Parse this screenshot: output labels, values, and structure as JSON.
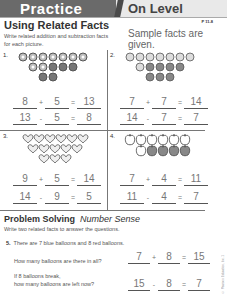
{
  "header": {
    "left": "Practice",
    "right": "On Level"
  },
  "title": "Using Related Facts",
  "page_number": "P 11-8",
  "instructions": "Write related addition and subtraction facts for each picture.",
  "sample_note": "Sample facts are given.",
  "problems": [
    {
      "number": "1.",
      "rows": [
        [
          7,
          "light"
        ],
        [
          2,
          "light",
          3,
          "dark"
        ],
        [
          2,
          "dark"
        ]
      ],
      "eq1": [
        "8",
        "+",
        "5",
        "=",
        "13"
      ],
      "eq2": [
        "13",
        "-",
        "5",
        "=",
        "8"
      ]
    },
    {
      "number": "2.",
      "rows": [
        [
          7,
          "light"
        ],
        [
          1,
          "light",
          4,
          "dark"
        ],
        [
          3,
          "dark"
        ]
      ],
      "eq1": [
        "7",
        "+",
        "7",
        "=",
        "14"
      ],
      "eq2": [
        "14",
        "-",
        "7",
        "=",
        "7"
      ]
    },
    {
      "number": "3.",
      "rows": [
        [
          6
        ],
        [
          5
        ],
        [
          3
        ]
      ],
      "eq1": [
        "9",
        "+",
        "5",
        "=",
        "14"
      ],
      "eq2": [
        "14",
        "-",
        "9",
        "=",
        "5"
      ]
    },
    {
      "number": "4.",
      "rows": [
        [
          6,
          "light"
        ],
        [
          1,
          "light",
          4,
          "dark"
        ]
      ],
      "eq1": [
        "7",
        "+",
        "4",
        "=",
        "11"
      ],
      "eq2": [
        "11",
        "-",
        "4",
        "=",
        "7"
      ]
    }
  ],
  "problem_solving": {
    "title": "Problem Solving",
    "subtitle": "Number Sense",
    "instructions": "Write two related facts to answer the questions.",
    "q_number": "5.",
    "q_text": "There are 7 blue balloons and 8 red balloons.",
    "q1": "How many balloons are there in all?",
    "q1_eq": [
      "7",
      "+",
      "8",
      "=",
      "15"
    ],
    "q2_line1": "If 8 balloons break,",
    "q2_line2": "how many balloons are left now?",
    "q2_eq": [
      "15",
      "-",
      "8",
      "=",
      "7"
    ]
  },
  "copyright": "© Pearson Education, Inc. 1"
}
